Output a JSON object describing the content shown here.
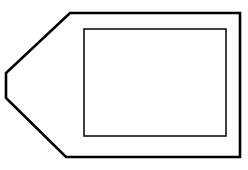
{
  "canvas": {
    "width": 248,
    "height": 170,
    "background_color": "#ffffff"
  },
  "figure": {
    "title": "line-drawing-hexagonal-tag-with-inner-rectangle",
    "stroke_color": "#000000",
    "fill_color": "#ffffff",
    "shapes": [
      {
        "name": "outer-polygon",
        "kind": "polygon",
        "stroke_color": "#000000",
        "stroke_width": 2.6,
        "fill_color": "#ffffff",
        "points": "70,13 240,13 240,157 66,157 6,98 6,73",
        "vertices": [
          {
            "x": 70,
            "y": 13
          },
          {
            "x": 240,
            "y": 13
          },
          {
            "x": 240,
            "y": 157
          },
          {
            "x": 66,
            "y": 157
          },
          {
            "x": 6,
            "y": 98
          },
          {
            "x": 6,
            "y": 73
          }
        ]
      },
      {
        "name": "inner-rectangle",
        "kind": "rectangle",
        "stroke_color": "#000000",
        "stroke_width": 1.5,
        "fill_color": "none",
        "x": 84,
        "y": 29,
        "width": 142,
        "height": 107
      }
    ]
  }
}
